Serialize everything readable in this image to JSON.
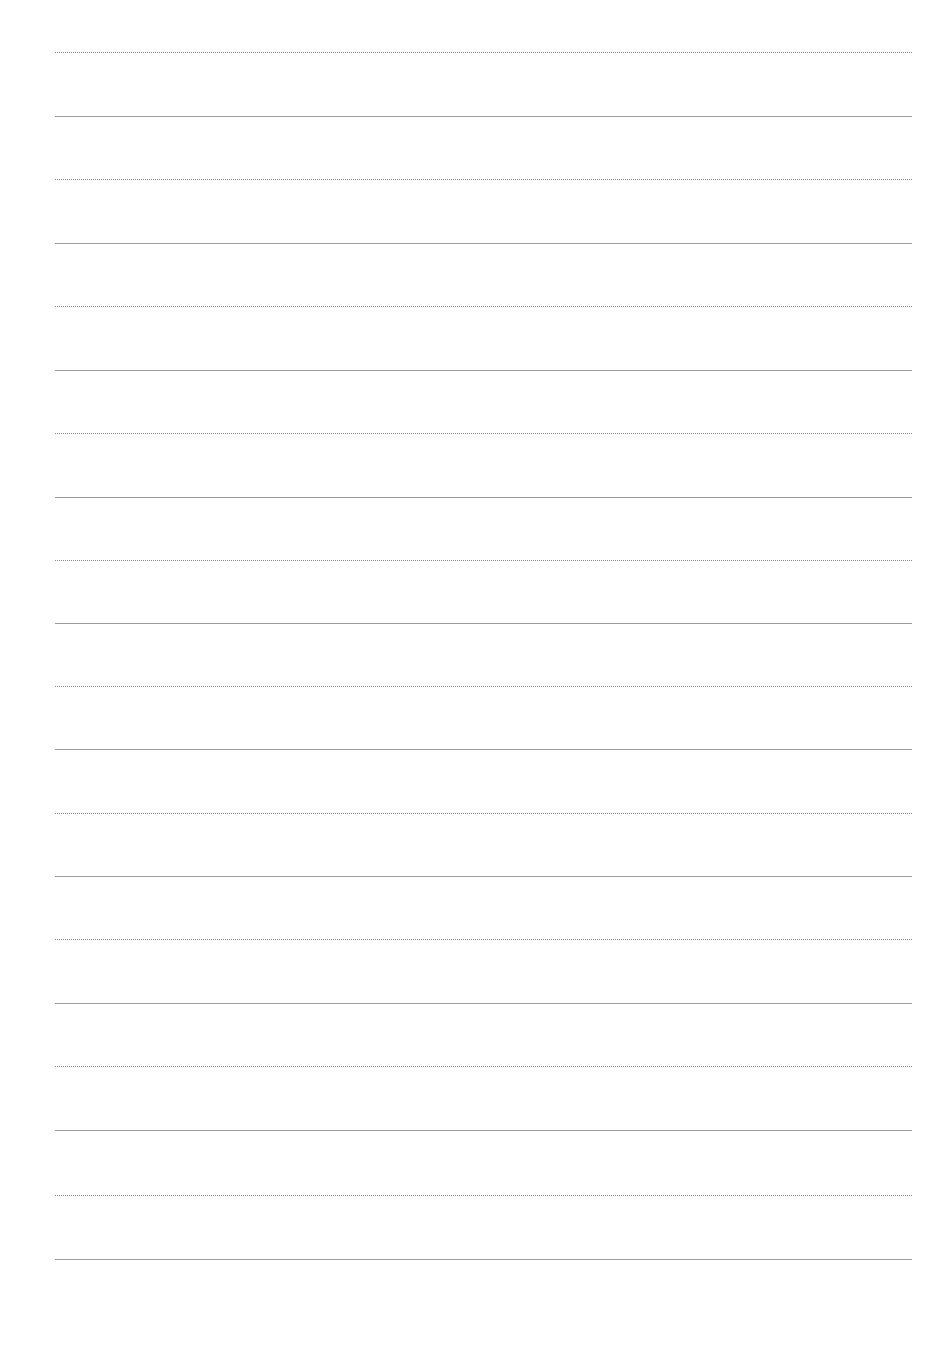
{
  "page": {
    "type": "ruled-sheet",
    "background": "#ffffff",
    "line_color_dotted": "#8a8a8a",
    "line_color_solid": "#9a9a9a",
    "lines": [
      {
        "style": "dotted",
        "y": 52
      },
      {
        "style": "solid",
        "y": 116
      },
      {
        "style": "dotted",
        "y": 179
      },
      {
        "style": "solid",
        "y": 243
      },
      {
        "style": "dotted",
        "y": 306
      },
      {
        "style": "solid",
        "y": 370
      },
      {
        "style": "dotted",
        "y": 433
      },
      {
        "style": "solid",
        "y": 497
      },
      {
        "style": "dotted",
        "y": 560
      },
      {
        "style": "solid",
        "y": 623
      },
      {
        "style": "dotted",
        "y": 686
      },
      {
        "style": "solid",
        "y": 749
      },
      {
        "style": "dotted",
        "y": 813
      },
      {
        "style": "solid",
        "y": 876
      },
      {
        "style": "dotted",
        "y": 939
      },
      {
        "style": "solid",
        "y": 1003
      },
      {
        "style": "dotted",
        "y": 1066
      },
      {
        "style": "solid",
        "y": 1130
      },
      {
        "style": "dotted",
        "y": 1195
      },
      {
        "style": "solid",
        "y": 1259
      }
    ]
  }
}
